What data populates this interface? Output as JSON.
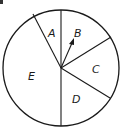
{
  "spinner": {
    "sections": [
      {
        "label": "A"
      },
      {
        "label": "B"
      },
      {
        "label": "C"
      },
      {
        "label": "D"
      },
      {
        "label": "E"
      }
    ],
    "arrow_points_to": "B"
  },
  "colors": {
    "line": "#1a1a1a",
    "background": "#ffffff"
  }
}
